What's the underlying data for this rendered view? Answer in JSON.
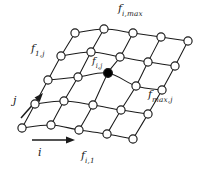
{
  "figure": {
    "title": "",
    "background_color": "#ffffff",
    "line_color": "#1a1a1a",
    "node_fill_color": "#ffffff",
    "highlight_node_color": "#000000",
    "width": 207,
    "height": 170
  },
  "labels": {
    "top_boundary": {
      "base": "f",
      "subscript": "i,max",
      "text": "f i,max"
    },
    "left_boundary": {
      "base": "f",
      "subscript": "1,j",
      "text": "f 1,j"
    },
    "center_node": {
      "base": "f",
      "subscript": "i,j",
      "text": "f i,j"
    },
    "right_boundary": {
      "base": "f",
      "subscript": "max,j",
      "text": "f max,j"
    },
    "bottom_boundary": {
      "base": "f",
      "subscript": "i,1",
      "text": "f i,1"
    },
    "axis_j": {
      "text": "j"
    },
    "axis_i": {
      "text": "i"
    }
  },
  "chart_data": {
    "type": "scatter",
    "title": "",
    "xlabel": "i",
    "ylabel": "j",
    "grid": true,
    "legend": null,
    "rows": 5,
    "columns": 5,
    "highlight_node": {
      "row": 2,
      "column": 2,
      "label": "f i,j",
      "x": 108,
      "y": 73
    },
    "node_radius": 4.1,
    "highlight_radius": 4.4,
    "nodes": [
      [
        {
          "x": 22,
          "y": 128
        },
        {
          "x": 51,
          "y": 125
        },
        {
          "x": 79,
          "y": 130
        },
        {
          "x": 107,
          "y": 134
        },
        {
          "x": 133,
          "y": 139
        }
      ],
      [
        {
          "x": 35,
          "y": 104
        },
        {
          "x": 64,
          "y": 101
        },
        {
          "x": 93,
          "y": 105
        },
        {
          "x": 121,
          "y": 110
        },
        {
          "x": 148,
          "y": 114
        }
      ],
      [
        {
          "x": 48,
          "y": 80
        },
        {
          "x": 78,
          "y": 77
        },
        {
          "x": 108,
          "y": 73
        },
        {
          "x": 136,
          "y": 86
        },
        {
          "x": 162,
          "y": 90
        }
      ],
      [
        {
          "x": 61,
          "y": 56
        },
        {
          "x": 91,
          "y": 52
        },
        {
          "x": 120,
          "y": 57
        },
        {
          "x": 148,
          "y": 62
        },
        {
          "x": 175,
          "y": 66
        }
      ],
      [
        {
          "x": 75,
          "y": 33
        },
        {
          "x": 104,
          "y": 29
        },
        {
          "x": 133,
          "y": 33
        },
        {
          "x": 161,
          "y": 37
        },
        {
          "x": 188,
          "y": 41
        }
      ]
    ],
    "axis_arrows": [
      {
        "name": "i",
        "from": {
          "x": 32,
          "y": 140
        },
        "to": {
          "x": 75,
          "y": 140
        }
      },
      {
        "name": "j",
        "from": {
          "x": 21,
          "y": 118
        },
        "to": {
          "x": 43,
          "y": 93
        }
      }
    ]
  }
}
